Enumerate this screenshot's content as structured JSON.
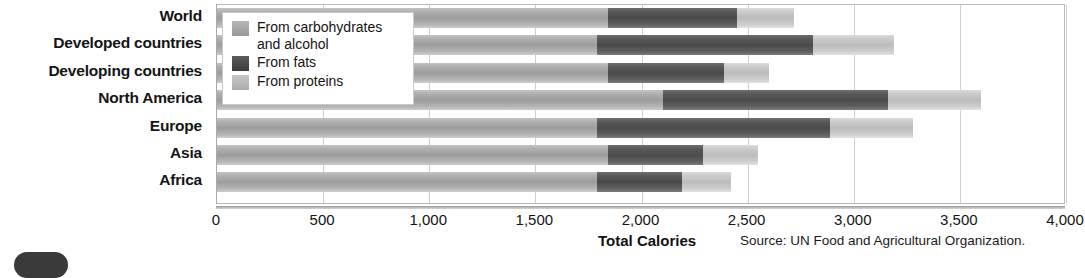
{
  "chart_data": {
    "type": "bar",
    "orientation": "horizontal",
    "stacked": true,
    "title": "",
    "xlabel": "Total Calories",
    "ylabel": "",
    "xlim": [
      0,
      4000
    ],
    "xticks": [
      "0",
      "500",
      "1,000",
      "1,500",
      "2,000",
      "2,500",
      "3,000",
      "3,500",
      "4,000"
    ],
    "xtick_values": [
      0,
      500,
      1000,
      1500,
      2000,
      2500,
      3000,
      3500,
      4000
    ],
    "grid": true,
    "legend_position": "upper-left-inside",
    "source": "Source: UN Food and Agricultural Organization.",
    "categories": [
      "World",
      "Developed countries",
      "Developing countries",
      "North America",
      "Europe",
      "Asia",
      "Africa"
    ],
    "series": [
      {
        "name": "From carbohydrates and alcohol",
        "key": "carbohydrates",
        "color": "#9c9c9c",
        "values": [
          1840,
          1790,
          1840,
          2100,
          1790,
          1840,
          1790
        ]
      },
      {
        "name": "From fats",
        "key": "fats",
        "color": "#4a4a4a",
        "values": [
          610,
          1020,
          550,
          1060,
          1100,
          450,
          400
        ]
      },
      {
        "name": "From proteins",
        "key": "proteins",
        "color": "#bcbcbc",
        "values": [
          270,
          380,
          210,
          440,
          390,
          260,
          230
        ]
      }
    ],
    "totals": [
      2720,
      3190,
      2600,
      3600,
      3280,
      2550,
      2420
    ]
  },
  "legend": {
    "items": [
      {
        "label": "From carbohydrates\nand alcohol",
        "swatch": "carb-swatch"
      },
      {
        "label": "From fats",
        "swatch": "fat-swatch"
      },
      {
        "label": "From proteins",
        "swatch": "prot-swatch"
      }
    ]
  },
  "axis": {
    "x_title": "Total Calories"
  },
  "footer": {
    "source": "Source: UN Food and Agricultural Organization."
  }
}
